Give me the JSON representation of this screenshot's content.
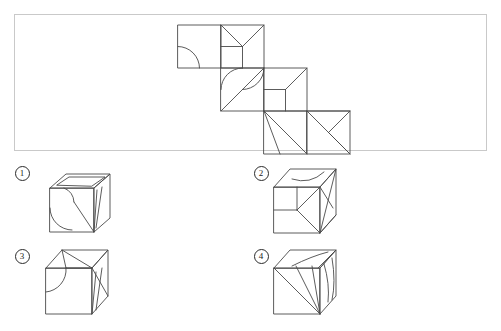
{
  "page": {
    "background_color": "#ffffff",
    "line_color": "#4a4a4a",
    "border_color": "#c9c9c9",
    "label_color": "#1a1a1a"
  },
  "question_panel": {
    "name": "net-panel",
    "border_color": "#c9c9c9",
    "x": 14,
    "y": 14,
    "width": 473,
    "height": 137,
    "net": {
      "type": "cube-net",
      "cell_size": 43,
      "description": "Six-square staircase net of a cube, three rows of two squares each, each row offset right by one square.",
      "faces": [
        {
          "id": "face-1",
          "row": 0,
          "col": 0,
          "x": 178,
          "y": 25,
          "markings": [
            "quarter-arc-from-left-edge-midpoint-to-bottom-edge-midpoint"
          ]
        },
        {
          "id": "face-2",
          "row": 0,
          "col": 1,
          "x": 221,
          "y": 25,
          "markings": [
            "diagonal-top-left-to-center",
            "diagonal-top-right-to-center",
            "horizontal-left-edge-midpoint-to-center",
            "vertical-center-to-bottom-edge-midpoint"
          ]
        },
        {
          "id": "face-3",
          "row": 1,
          "col": 1,
          "x": 221,
          "y": 68,
          "markings": [
            "arc-from-top-edge-midpoint-to-center",
            "arc-from-center-to-right-edge-midpoint",
            "diagonal-bottom-left-corner-to-center"
          ]
        },
        {
          "id": "face-4",
          "row": 1,
          "col": 2,
          "x": 264,
          "y": 68,
          "markings": [
            "diagonal-top-right-corner-to-center",
            "horizontal-left-edge-midpoint-to-center",
            "vertical-center-to-bottom-edge-midpoint"
          ]
        },
        {
          "id": "face-5",
          "row": 2,
          "col": 2,
          "x": 264,
          "y": 111,
          "markings": [
            "diagonal-top-left-corner-to-bottom-right-corner",
            "line-top-left-corner-to-bottom-edge-quarter-point"
          ]
        },
        {
          "id": "face-6",
          "row": 2,
          "col": 3,
          "x": 307,
          "y": 111,
          "markings": [
            "diagonal-top-right-corner-to-left-edge-midpoint",
            "diagonal-bottom-right-corner-to-left-edge-midpoint",
            "diagonal-top-right-corner-to-bottom-right-corner-region"
          ]
        }
      ]
    }
  },
  "options": [
    {
      "id": "option-1",
      "label": "①",
      "numeral": "1",
      "label_x": 14,
      "label_y": 166,
      "cube_x": 44,
      "cube_y": 170,
      "faces": {
        "top": [
          "inner-quadrilateral-outline"
        ],
        "front": [
          "large-quarter-arc",
          "small-arc"
        ],
        "right": [
          "narrow-triangle-sliver"
        ]
      }
    },
    {
      "id": "option-2",
      "label": "②",
      "numeral": "2",
      "label_x": 253,
      "label_y": 166,
      "cube_x": 272,
      "cube_y": 168,
      "faces": {
        "top": [
          "shallow-arc"
        ],
        "front": [
          "horizontal-mid-line",
          "vertical-mid-line",
          "diagonal-to-bottom-right"
        ],
        "right": [
          "two-triangles"
        ]
      }
    },
    {
      "id": "option-3",
      "label": "③",
      "numeral": "3",
      "label_x": 14,
      "label_y": 249,
      "cube_x": 44,
      "cube_y": 246,
      "faces": {
        "top": [
          "vertical-line",
          "diagonal-line"
        ],
        "front": [
          "quarter-arc"
        ],
        "right": [
          "narrow-triangle-sliver"
        ]
      }
    },
    {
      "id": "option-4",
      "label": "④",
      "numeral": "4",
      "label_x": 253,
      "label_y": 249,
      "cube_x": 272,
      "cube_y": 246,
      "faces": {
        "top": [
          "arc",
          "triangle"
        ],
        "front": [
          "diagonal-fan-to-bottom-right"
        ],
        "right": [
          "curved-sliver"
        ]
      }
    }
  ]
}
